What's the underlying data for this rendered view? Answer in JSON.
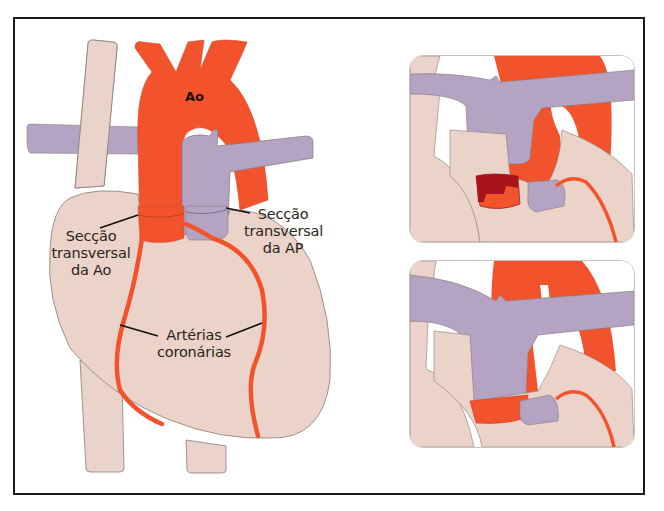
{
  "figure": {
    "main": {
      "labels": {
        "aorta": "Ao",
        "aorta_section": [
          "Secção",
          "transversal",
          "da Ao"
        ],
        "pa_section": [
          "Secção",
          "transversal",
          "da AP"
        ],
        "coronary": [
          "Artérias",
          "coronárias"
        ]
      }
    },
    "panels": [
      {
        "name": "top-detail",
        "description": "coronary button excised from aortic root"
      },
      {
        "name": "bottom-detail",
        "description": "great arteries switched, coronary reimplanted"
      }
    ],
    "colors": {
      "aorta": "#f2532c",
      "pulmonary": "#b4a3c3",
      "heart": "#ecd3c9",
      "vena": "#e9d3cb",
      "coronary_button": "#a8141a",
      "outline": "#8a7c78",
      "frame": "#1a1a1a"
    }
  }
}
